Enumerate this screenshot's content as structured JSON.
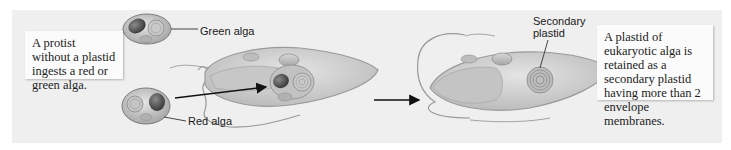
{
  "diagram": {
    "steps": [
      {
        "caption": "A protist without a plastid ingests a red or green alga."
      },
      {
        "caption": "A plastid of eukaryotic alga is retained as a secondary plastid having more than 2 envelope membranes."
      }
    ],
    "labels": {
      "green_alga": "Green alga",
      "red_alga": "Red alga",
      "secondary_plastid_line1": "Secondary",
      "secondary_plastid_line2": "plastid"
    },
    "colors": {
      "panel_background": "#efefef",
      "textbox_background": "#fbfbfb",
      "cell_fill": "#cfcfcf",
      "cell_outline": "#8a8a8a",
      "arrow": "#111111"
    }
  }
}
